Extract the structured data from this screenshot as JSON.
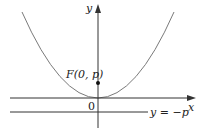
{
  "diagram": {
    "type": "parabola-focus-directrix",
    "labels": {
      "y_axis": "y",
      "x_axis": "x",
      "origin": "0",
      "focus": "F(0, p)",
      "directrix": "y = −p"
    },
    "colors": {
      "curve": "#7a7a7a",
      "axes": "#333333",
      "point": "#111111"
    }
  }
}
